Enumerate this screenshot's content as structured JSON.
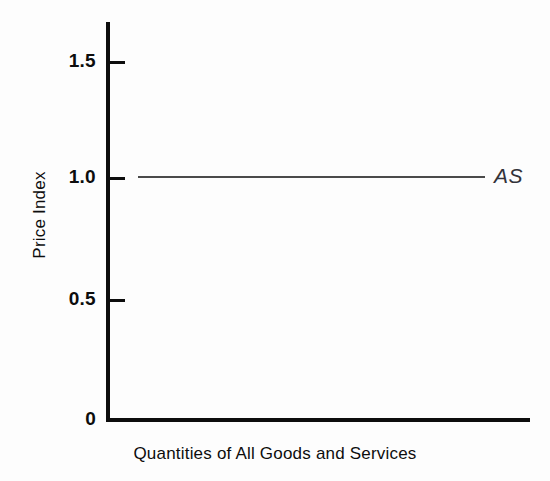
{
  "chart_data": {
    "type": "line",
    "title": "",
    "subtitle": "",
    "xlabel": "Quantities of All Goods and Services",
    "ylabel": "Price Index",
    "ylim": [
      0,
      1.65
    ],
    "xlim": [
      0,
      1
    ],
    "yticks": [
      "0",
      "0.5",
      "1.0",
      "1.5"
    ],
    "ytick_values": [
      0,
      0.5,
      1.0,
      1.5
    ],
    "xticks": [],
    "grid": false,
    "legend_position": "inline-right",
    "series": [
      {
        "name": "AS",
        "label": "AS",
        "color": "#4a4a4a",
        "style": "horizontal-line",
        "x": [
          0.08,
          0.9
        ],
        "values": [
          1.02,
          1.02
        ],
        "constant_value": 1.02
      }
    ],
    "annotations": [
      {
        "text": "AS",
        "x": 0.95,
        "y": 1.02,
        "style": "italic"
      }
    ]
  },
  "axes": {
    "y": {
      "title": "Price Index",
      "ticks": [
        {
          "label": "1.5",
          "value": 1.5
        },
        {
          "label": "1.0",
          "value": 1.0
        },
        {
          "label": "0.5",
          "value": 0.5
        },
        {
          "label": "0",
          "value": 0
        }
      ]
    },
    "x": {
      "title": "Quantities of All Goods and Services"
    }
  },
  "series_labels": {
    "as": "AS"
  },
  "colors": {
    "background": "#fdfdfd",
    "axis": "#0d0d0d",
    "series_as": "#4a4a4a",
    "text": "#0d0d0d",
    "annotation": "#33333a"
  }
}
